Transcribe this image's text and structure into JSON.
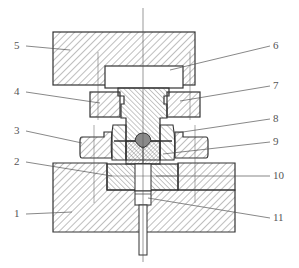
{
  "diagram": {
    "type": "mechanical-cross-section",
    "colors": {
      "outline": "#333333",
      "hatch": "#444444",
      "leader": "#555555",
      "label": "#555555",
      "background": "#ffffff",
      "billet": "#8a8a8a"
    },
    "labels": [
      {
        "id": "1",
        "text": "1",
        "x": 18,
        "y": 210,
        "side": "left"
      },
      {
        "id": "2",
        "text": "2",
        "x": 18,
        "y": 158,
        "side": "left"
      },
      {
        "id": "3",
        "text": "3",
        "x": 18,
        "y": 127,
        "side": "left"
      },
      {
        "id": "4",
        "text": "4",
        "x": 18,
        "y": 88,
        "side": "left"
      },
      {
        "id": "5",
        "text": "5",
        "x": 18,
        "y": 42,
        "side": "left"
      },
      {
        "id": "6",
        "text": "6",
        "x": 272,
        "y": 42,
        "side": "right"
      },
      {
        "id": "7",
        "text": "7",
        "x": 272,
        "y": 82,
        "side": "right"
      },
      {
        "id": "8",
        "text": "8",
        "x": 272,
        "y": 115,
        "side": "right"
      },
      {
        "id": "9",
        "text": "9",
        "x": 272,
        "y": 138,
        "side": "right"
      },
      {
        "id": "10",
        "text": "10",
        "x": 272,
        "y": 172,
        "side": "right"
      },
      {
        "id": "11",
        "text": "11",
        "x": 272,
        "y": 214,
        "side": "right"
      }
    ]
  }
}
